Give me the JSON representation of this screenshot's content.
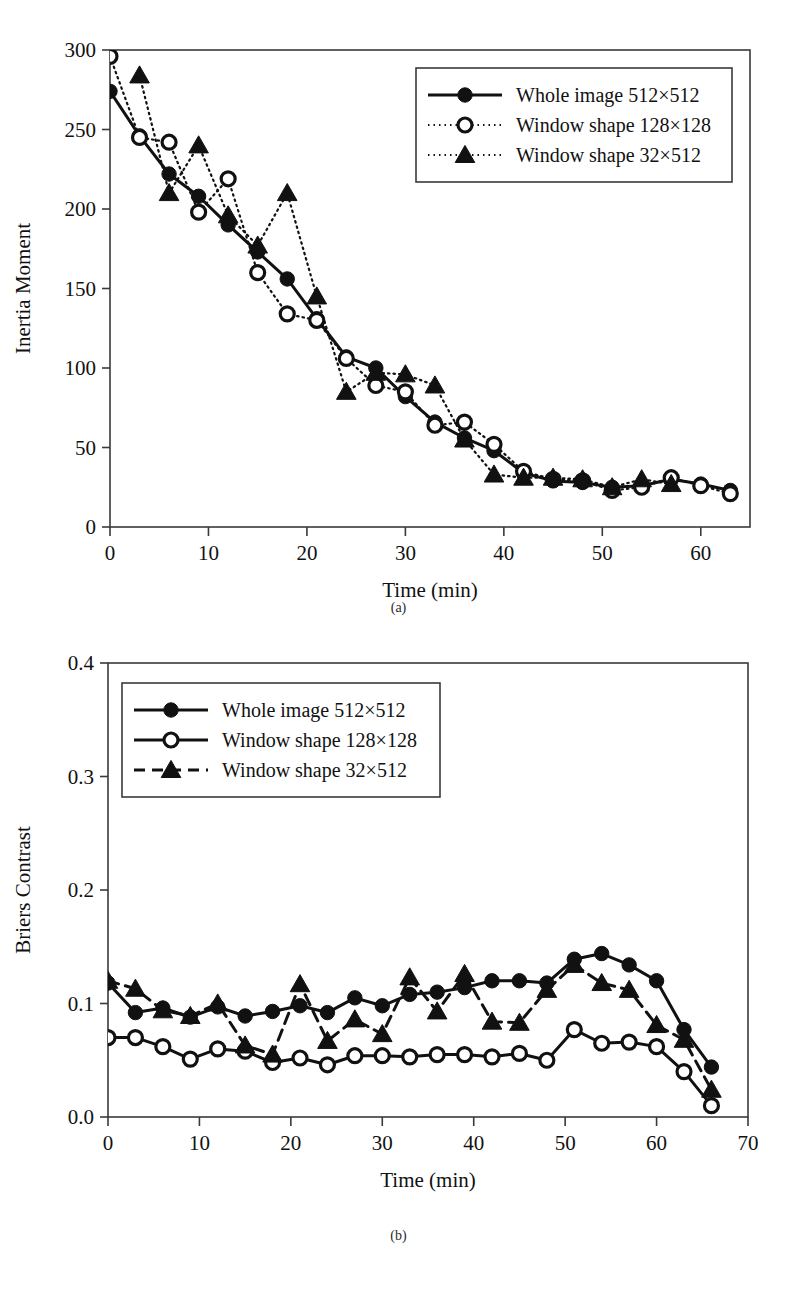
{
  "figure": {
    "panel_a_caption": "(a)",
    "panel_b_caption": "(b)"
  },
  "chart_data": [
    {
      "id": "panel-a",
      "type": "line",
      "title": "",
      "xlabel": "Time (min)",
      "ylabel": "Inertia Moment",
      "xlim": [
        0,
        65
      ],
      "ylim": [
        0,
        300
      ],
      "xticks": [
        0,
        10,
        20,
        30,
        40,
        50,
        60
      ],
      "yticks": [
        0,
        50,
        100,
        150,
        200,
        250,
        300
      ],
      "xticklabels": [
        "0",
        "10",
        "20",
        "30",
        "40",
        "50",
        "60"
      ],
      "yticklabels": [
        "0",
        "50",
        "100",
        "150",
        "200",
        "250",
        "300"
      ],
      "grid": false,
      "legend_position": "upper right",
      "series": [
        {
          "name": "Whole image 512×512",
          "marker": "filled-circle",
          "linestyle": "solid",
          "x": [
            0,
            3,
            6,
            9,
            12,
            15,
            18,
            21,
            24,
            27,
            30,
            33,
            36,
            39,
            42,
            45,
            48,
            51,
            54,
            57,
            60,
            63
          ],
          "y": [
            274,
            246,
            222,
            208,
            190,
            173,
            156,
            131,
            107,
            100,
            82,
            66,
            56,
            48,
            34,
            29,
            28,
            25,
            26,
            30,
            27,
            23
          ]
        },
        {
          "name": "Window shape 128×128",
          "marker": "open-circle",
          "linestyle": "dotted",
          "x": [
            0,
            3,
            6,
            9,
            12,
            15,
            18,
            21,
            24,
            27,
            30,
            33,
            36,
            39,
            42,
            45,
            48,
            51,
            54,
            57,
            60,
            63
          ],
          "y": [
            296,
            245,
            242,
            198,
            219,
            160,
            134,
            130,
            106,
            89,
            85,
            64,
            66,
            52,
            35,
            30,
            29,
            23,
            25,
            31,
            26,
            21
          ]
        },
        {
          "name": "Window shape 32×512",
          "marker": "filled-triangle",
          "linestyle": "dotted",
          "x": [
            3,
            6,
            9,
            12,
            15,
            18,
            21,
            24,
            27,
            30,
            33,
            36,
            39,
            42,
            45,
            48,
            51,
            54,
            57
          ],
          "y": [
            284,
            210,
            240,
            196,
            177,
            210,
            145,
            85,
            97,
            96,
            89,
            55,
            33,
            31,
            31,
            30,
            25,
            30,
            27
          ]
        }
      ]
    },
    {
      "id": "panel-b",
      "type": "line",
      "title": "",
      "xlabel": "Time (min)",
      "ylabel": "Briers Contrast",
      "xlim": [
        0,
        70
      ],
      "ylim": [
        0.0,
        0.4
      ],
      "xticks": [
        0,
        10,
        20,
        30,
        40,
        50,
        60,
        70
      ],
      "yticks": [
        0.0,
        0.1,
        0.2,
        0.3,
        0.4
      ],
      "xticklabels": [
        "0",
        "10",
        "20",
        "30",
        "40",
        "50",
        "60",
        "70"
      ],
      "yticklabels": [
        "0.0",
        "0.1",
        "0.2",
        "0.3",
        "0.4"
      ],
      "grid": false,
      "legend_position": "upper left",
      "series": [
        {
          "name": "Whole image 512×512",
          "marker": "filled-circle",
          "linestyle": "solid",
          "x": [
            0,
            3,
            6,
            9,
            12,
            15,
            18,
            21,
            24,
            27,
            30,
            33,
            36,
            39,
            42,
            45,
            48,
            51,
            54,
            57,
            60,
            63,
            66
          ],
          "y": [
            0.118,
            0.092,
            0.096,
            0.088,
            0.097,
            0.089,
            0.093,
            0.098,
            0.092,
            0.105,
            0.098,
            0.108,
            0.11,
            0.114,
            0.12,
            0.12,
            0.118,
            0.139,
            0.144,
            0.134,
            0.12,
            0.077,
            0.044
          ]
        },
        {
          "name": "Window shape 128×128",
          "marker": "open-circle",
          "linestyle": "solid",
          "x": [
            0,
            3,
            6,
            9,
            12,
            15,
            18,
            21,
            24,
            27,
            30,
            33,
            36,
            39,
            42,
            45,
            48,
            51,
            54,
            57,
            60,
            63,
            66
          ],
          "y": [
            0.07,
            0.07,
            0.062,
            0.051,
            0.06,
            0.058,
            0.048,
            0.052,
            0.046,
            0.054,
            0.054,
            0.053,
            0.055,
            0.055,
            0.053,
            0.056,
            0.05,
            0.077,
            0.065,
            0.066,
            0.062,
            0.04,
            0.01
          ]
        },
        {
          "name": "Window shape 32×512",
          "marker": "filled-triangle",
          "linestyle": "dashed",
          "x": [
            0,
            3,
            6,
            9,
            12,
            15,
            18,
            21,
            24,
            27,
            30,
            33,
            36,
            39,
            42,
            45,
            48,
            51,
            54,
            57,
            60,
            63,
            66
          ],
          "y": [
            0.12,
            0.113,
            0.094,
            0.089,
            0.1,
            0.063,
            0.055,
            0.117,
            0.067,
            0.086,
            0.073,
            0.123,
            0.093,
            0.126,
            0.084,
            0.083,
            0.112,
            0.134,
            0.118,
            0.112,
            0.081,
            0.068,
            0.024
          ]
        }
      ]
    }
  ]
}
